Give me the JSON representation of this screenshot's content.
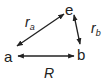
{
  "diagram": {
    "type": "distance-triangle",
    "nodes": [
      {
        "id": "e",
        "label": "e",
        "x": 69,
        "y": 14
      },
      {
        "id": "a",
        "label": "a",
        "x": 8,
        "y": 61
      },
      {
        "id": "b",
        "label": "b",
        "x": 81,
        "y": 59
      }
    ],
    "edges": [
      {
        "from": "a",
        "to": "e",
        "label": "r",
        "subscript": "a",
        "bidirectional": true
      },
      {
        "from": "e",
        "to": "b",
        "label": "r",
        "subscript": "b",
        "bidirectional": true
      },
      {
        "from": "a",
        "to": "b",
        "label": "R",
        "subscript": "",
        "bidirectional": true
      }
    ],
    "colors": {
      "stroke": "#222222",
      "text": "#222222",
      "background": "#ffffff"
    }
  }
}
